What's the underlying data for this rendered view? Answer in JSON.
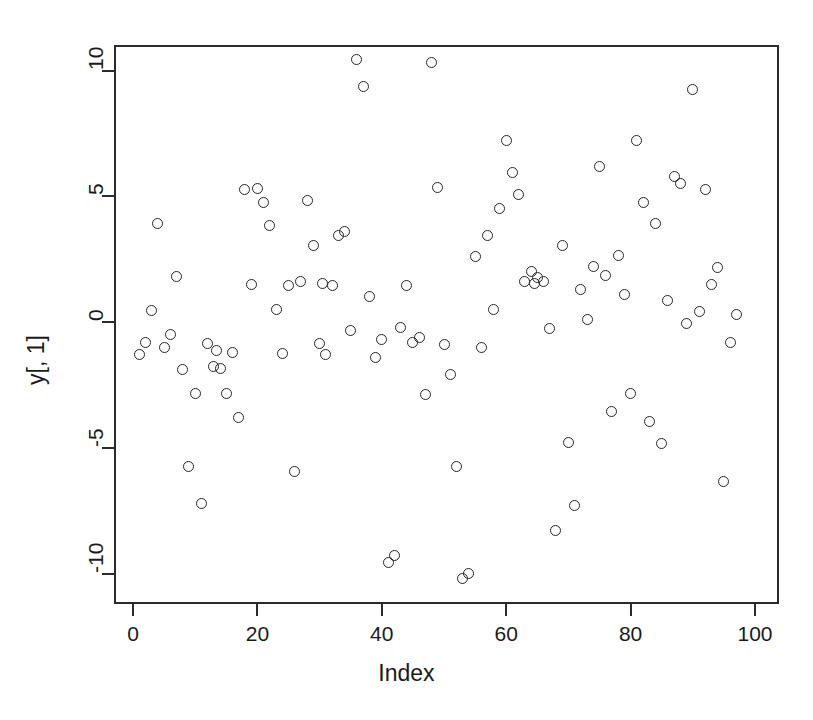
{
  "chart_data": {
    "type": "scatter",
    "title": "",
    "xlabel": "Index",
    "ylabel": "y[, 1]",
    "xlim": [
      -2.5,
      104
    ],
    "ylim": [
      -11.2,
      11.1
    ],
    "xticks": [
      0,
      20,
      40,
      60,
      80,
      100
    ],
    "yticks": [
      -10,
      -5,
      0,
      5,
      10
    ],
    "grid": false,
    "legend": null,
    "marker": "open-circle",
    "marker_color": "#262626",
    "n_points": 100,
    "points": [
      {
        "x": 1,
        "y": -1.3
      },
      {
        "x": 2,
        "y": -0.8
      },
      {
        "x": 3,
        "y": 0.45
      },
      {
        "x": 4,
        "y": 3.9
      },
      {
        "x": 5,
        "y": -1.0
      },
      {
        "x": 6,
        "y": -0.5
      },
      {
        "x": 7,
        "y": 1.8
      },
      {
        "x": 8,
        "y": -1.9
      },
      {
        "x": 9,
        "y": -5.75
      },
      {
        "x": 10,
        "y": -2.85
      },
      {
        "x": 11,
        "y": -7.2
      },
      {
        "x": 12,
        "y": -0.85
      },
      {
        "x": 13,
        "y": -1.75
      },
      {
        "x": 14,
        "y": -1.85
      },
      {
        "x": 15,
        "y": -2.85
      },
      {
        "x": 16,
        "y": -1.2
      },
      {
        "x": 17,
        "y": -3.8
      },
      {
        "x": 18,
        "y": 5.25
      },
      {
        "x": 19,
        "y": 1.5
      },
      {
        "x": 20,
        "y": 5.3
      },
      {
        "x": 21,
        "y": 4.75
      },
      {
        "x": 22,
        "y": 3.85
      },
      {
        "x": 23,
        "y": 0.5
      },
      {
        "x": 24,
        "y": -1.25
      },
      {
        "x": 25,
        "y": 1.45
      },
      {
        "x": 26,
        "y": -5.95
      },
      {
        "x": 27,
        "y": 1.6
      },
      {
        "x": 28,
        "y": 4.85
      },
      {
        "x": 29,
        "y": 3.05
      },
      {
        "x": 30,
        "y": -0.85
      },
      {
        "x": 31,
        "y": -1.3
      },
      {
        "x": 32,
        "y": 1.45
      },
      {
        "x": 33,
        "y": 3.45
      },
      {
        "x": 34,
        "y": 3.6
      },
      {
        "x": 35,
        "y": -0.35
      },
      {
        "x": 36,
        "y": 10.45
      },
      {
        "x": 37,
        "y": 9.35
      },
      {
        "x": 38,
        "y": 1.0
      },
      {
        "x": 39,
        "y": -1.4
      },
      {
        "x": 40,
        "y": -0.7
      },
      {
        "x": 41,
        "y": -9.55
      },
      {
        "x": 42,
        "y": -9.3
      },
      {
        "x": 43,
        "y": -0.2
      },
      {
        "x": 44,
        "y": 1.45
      },
      {
        "x": 45,
        "y": -0.8
      },
      {
        "x": 46,
        "y": -0.6
      },
      {
        "x": 47,
        "y": -2.9
      },
      {
        "x": 48,
        "y": 10.3
      },
      {
        "x": 49,
        "y": 5.35
      },
      {
        "x": 50,
        "y": -0.9
      },
      {
        "x": 51,
        "y": -2.1
      },
      {
        "x": 52,
        "y": -5.75
      },
      {
        "x": 53,
        "y": -10.2
      },
      {
        "x": 54,
        "y": -10.0
      },
      {
        "x": 55,
        "y": 2.6
      },
      {
        "x": 56,
        "y": -1.0
      },
      {
        "x": 57,
        "y": 3.45
      },
      {
        "x": 58,
        "y": 0.5
      },
      {
        "x": 59,
        "y": 4.5
      },
      {
        "x": 60,
        "y": 7.2
      },
      {
        "x": 61,
        "y": 5.95
      },
      {
        "x": 62,
        "y": 5.05
      },
      {
        "x": 63,
        "y": 1.6
      },
      {
        "x": 64,
        "y": 2.0
      },
      {
        "x": 65,
        "y": 1.75
      },
      {
        "x": 66,
        "y": 1.6
      },
      {
        "x": 67,
        "y": -0.25
      },
      {
        "x": 68,
        "y": -8.3
      },
      {
        "x": 69,
        "y": 3.05
      },
      {
        "x": 70,
        "y": -4.8
      },
      {
        "x": 71,
        "y": -7.3
      },
      {
        "x": 72,
        "y": 1.3
      },
      {
        "x": 73,
        "y": 0.1
      },
      {
        "x": 74,
        "y": 2.2
      },
      {
        "x": 75,
        "y": 6.2
      },
      {
        "x": 76,
        "y": 1.85
      },
      {
        "x": 77,
        "y": -3.55
      },
      {
        "x": 78,
        "y": 2.65
      },
      {
        "x": 79,
        "y": 1.1
      },
      {
        "x": 80,
        "y": -2.85
      },
      {
        "x": 81,
        "y": 7.2
      },
      {
        "x": 82,
        "y": 4.75
      },
      {
        "x": 83,
        "y": -3.95
      },
      {
        "x": 84,
        "y": 3.9
      },
      {
        "x": 85,
        "y": -4.85
      },
      {
        "x": 86,
        "y": 0.85
      },
      {
        "x": 87,
        "y": 5.8
      },
      {
        "x": 88,
        "y": 5.5
      },
      {
        "x": 89,
        "y": -0.05
      },
      {
        "x": 90,
        "y": 9.25
      },
      {
        "x": 91,
        "y": 0.4
      },
      {
        "x": 92,
        "y": 5.25
      },
      {
        "x": 93,
        "y": 1.5
      },
      {
        "x": 94,
        "y": 2.15
      },
      {
        "x": 95,
        "y": -6.35
      },
      {
        "x": 96,
        "y": -0.8
      },
      {
        "x": 97,
        "y": 0.3
      },
      {
        "x": 13.5,
        "y": -1.15
      },
      {
        "x": 30.5,
        "y": 1.55
      },
      {
        "x": 64.5,
        "y": 1.55
      }
    ]
  },
  "axes": {
    "x_tick_labels": [
      "0",
      "20",
      "40",
      "60",
      "80",
      "100"
    ],
    "y_tick_labels": [
      "-10",
      "-5",
      "0",
      "5",
      "10"
    ],
    "x_title": "Index",
    "y_title": "y[, 1]"
  }
}
